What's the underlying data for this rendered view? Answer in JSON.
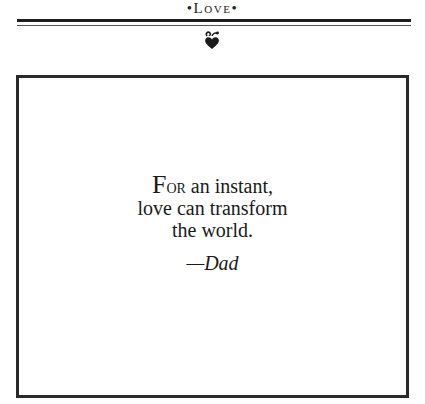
{
  "header": {
    "running_head": "•Love•",
    "ornament_icon": "heart-fleuron-icon"
  },
  "quote": {
    "dropcap": "F",
    "smallcap_rest": "or",
    "line1_rest": " an instant,",
    "line2": "love can transform",
    "line3": "the world.",
    "attribution": "—Dad"
  },
  "colors": {
    "ink": "#1a1a1a",
    "rule": "#1e1e1e",
    "frame": "#2a2a2a",
    "background": "#ffffff"
  }
}
